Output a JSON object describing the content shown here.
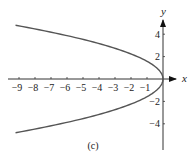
{
  "chart_data": {
    "type": "line",
    "title": "",
    "caption": "(c)",
    "xlabel": "x",
    "ylabel": "y",
    "xlim": [
      -9.6,
      0.6
    ],
    "ylim": [
      -4.8,
      5.2
    ],
    "grid": false,
    "legend": null,
    "x_ticks": [
      -9,
      -8,
      -7,
      -6,
      -5,
      -4,
      -3,
      -2,
      -1
    ],
    "x_tick_labels": [
      "−9",
      "−8",
      "−7",
      "−6",
      "−5",
      "−4",
      "−3",
      "−2",
      "−1"
    ],
    "y_ticks": [
      -4,
      -2,
      2,
      4
    ],
    "y_tick_labels": [
      "−4",
      "−2",
      "2",
      "4"
    ],
    "series": [
      {
        "name": "x = -0.4 y^2",
        "description": "Parabola opening left with vertex at origin",
        "points": [
          {
            "x": -9.2,
            "y": 4.8
          },
          {
            "x": -6.4,
            "y": 4.0
          },
          {
            "x": -3.6,
            "y": 3.0
          },
          {
            "x": -1.6,
            "y": 2.0
          },
          {
            "x": -0.4,
            "y": 1.0
          },
          {
            "x": 0.0,
            "y": 0.0
          },
          {
            "x": -0.4,
            "y": -1.0
          },
          {
            "x": -1.6,
            "y": -2.0
          },
          {
            "x": -3.6,
            "y": -3.0
          },
          {
            "x": -6.4,
            "y": -4.0
          },
          {
            "x": -9.2,
            "y": -4.8
          }
        ],
        "color": "#555555"
      }
    ]
  }
}
